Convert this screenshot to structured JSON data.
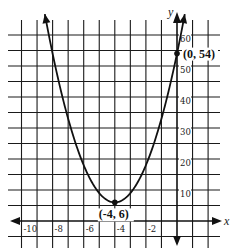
{
  "chart_data": {
    "type": "line",
    "title": "",
    "function": "y = 3(x + 4)^2 + 6",
    "xlabel": "x",
    "ylabel": "y",
    "xlim": [
      -11,
      2.8
    ],
    "ylim": [
      -8,
      66
    ],
    "grid": true,
    "x_grid_step": 1,
    "y_grid_step": 5,
    "x_ticks": [
      {
        "value": -10,
        "label": "-10"
      },
      {
        "value": -8,
        "label": "-8"
      },
      {
        "value": -6,
        "label": "-6"
      },
      {
        "value": -4,
        "label": "-4"
      },
      {
        "value": -2,
        "label": "-2"
      }
    ],
    "y_ticks": [
      {
        "value": 10,
        "label": "10"
      },
      {
        "value": 20,
        "label": "20"
      },
      {
        "value": 30,
        "label": "30"
      },
      {
        "value": 40,
        "label": "40"
      },
      {
        "value": 50,
        "label": "50"
      },
      {
        "value": 60,
        "label": "60"
      }
    ],
    "series": [
      {
        "name": "parabola",
        "x": [
          -8.5,
          -8,
          -7,
          -6,
          -5,
          -4,
          -3,
          -2,
          -1,
          0,
          0.5
        ],
        "y": [
          66.75,
          54,
          33,
          18,
          9,
          6,
          9,
          18,
          33,
          54,
          66.75
        ]
      }
    ],
    "annotations": [
      {
        "x": -4,
        "y": 6,
        "label": "(-4, 6)",
        "marker": "dot"
      },
      {
        "x": 0,
        "y": 54,
        "label": "(0, 54)",
        "marker": "dot"
      }
    ],
    "colors": {
      "line": "#111111",
      "grid": "#1a1a1a",
      "background": "#ffffff"
    }
  }
}
